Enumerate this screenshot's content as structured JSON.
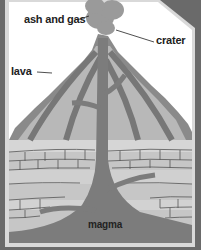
{
  "labels": {
    "ash_and_gas": "ash and gas",
    "crater": "crater",
    "lava": "lava",
    "magma": "magma"
  },
  "colors": {
    "background": "#6a6a6a",
    "panel": "#ffffff",
    "frame": "#d8d8d8",
    "volcano_outer": "#8a8a8a",
    "volcano_layer_light": "#b4b4b4",
    "volcano_layer_dark": "#7a7a7a",
    "magma": "#7c7c7c",
    "rock": "#c8c8c8",
    "cloud": "#999999"
  }
}
